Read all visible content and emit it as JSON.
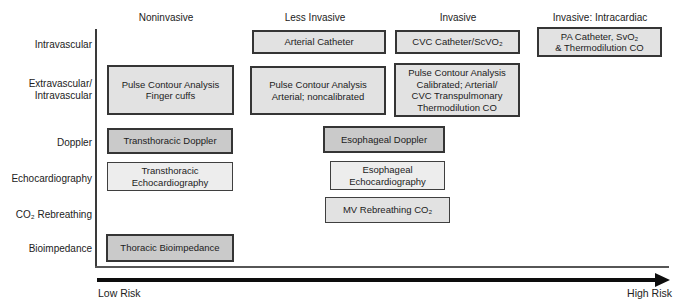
{
  "columns": [
    {
      "label": "Noninvasive"
    },
    {
      "label": "Less Invasive"
    },
    {
      "label": "Invasive"
    },
    {
      "label": "Invasive: Intracardiac"
    }
  ],
  "rows": [
    {
      "label": "Intravascular"
    },
    {
      "label": "Extravascular/\nIntravascular"
    },
    {
      "label": "Doppler"
    },
    {
      "label": "Echocardiography"
    },
    {
      "label": "CO₂ Rebreathing"
    },
    {
      "label": "Bioimpedance"
    }
  ],
  "boxes": {
    "arterial_catheter": {
      "label": "Arterial Catheter"
    },
    "cvc_catheter": {
      "label": "CVC Catheter/ScVO₂"
    },
    "pa_catheter": {
      "label": "PA Catheter, SvO₂\n& Thermodilution CO"
    },
    "pca_finger_cuffs": {
      "label": "Pulse Contour Analysis\nFinger cuffs"
    },
    "pca_arterial": {
      "label": "Pulse Contour Analysis\nArterial; noncalibrated"
    },
    "pca_calibrated": {
      "label": "Pulse Contour Analysis\nCalibrated; Arterial/\nCVC Transpulmonary\nThermodilution CO"
    },
    "transthoracic_doppler": {
      "label": "Transthoracic Doppler"
    },
    "esophageal_doppler": {
      "label": "Esophageal Doppler"
    },
    "transthoracic_echo": {
      "label": "Transthoracic\nEchocardiography"
    },
    "esophageal_echo": {
      "label": "Esophageal\nEchocardiography"
    },
    "mv_rebreathing": {
      "label": "MV Rebreathing CO₂"
    },
    "thoracic_bioimpedance": {
      "label": "Thoracic Bioimpedance"
    }
  },
  "risk_axis": {
    "low_label": "Low Risk",
    "high_label": "High Risk"
  },
  "colors": {
    "light": "#e2e2e2",
    "lighter": "#ededed",
    "dark": "#cacaca",
    "border": "#3f3f3f",
    "arrow": "#0d0d0d"
  }
}
